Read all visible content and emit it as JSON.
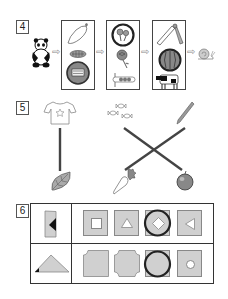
{
  "sections": [
    {
      "number": "4",
      "description": "Sequence puzzle: panda → box of items → box of items → box of items → snail",
      "start_item": "panda",
      "end_item": "snail",
      "boxes": [
        {
          "items": [
            "radish",
            "caterpillar",
            "circled-coin-image"
          ]
        },
        {
          "items": [
            "circled-flowers",
            "rose",
            "sign-beads"
          ]
        },
        {
          "items": [
            "slide",
            "circled-watermelon",
            "cow"
          ]
        }
      ],
      "arrow_glyph": "⇨"
    },
    {
      "number": "5",
      "description": "Matching lines puzzle",
      "top_items": [
        "t-shirt",
        "candies",
        "pencil"
      ],
      "bottom_items": [
        "leaf",
        "carrot",
        "apple"
      ],
      "connections": [
        {
          "from": "t-shirt",
          "to": "leaf"
        },
        {
          "from": "candies",
          "to": "apple"
        },
        {
          "from": "pencil",
          "to": "carrot"
        }
      ]
    },
    {
      "number": "6",
      "description": "Shape folding/cutting puzzle grid",
      "rows": [
        {
          "question": "rectangle-with-triangle-cut",
          "options": [
            "square-hole",
            "triangle-hole",
            "diamond-hole",
            "left-triangle-hole"
          ],
          "circled_index": 2
        },
        {
          "question": "triangle-with-corner-cut",
          "options": [
            "one-corner-cut",
            "four-corners-cut",
            "plain-square",
            "circle-hole"
          ],
          "circled_index": 2
        }
      ]
    }
  ],
  "colors": {
    "shape_fill": "#d0d0d0",
    "line": "#444444",
    "answer_circle": "#222222"
  }
}
